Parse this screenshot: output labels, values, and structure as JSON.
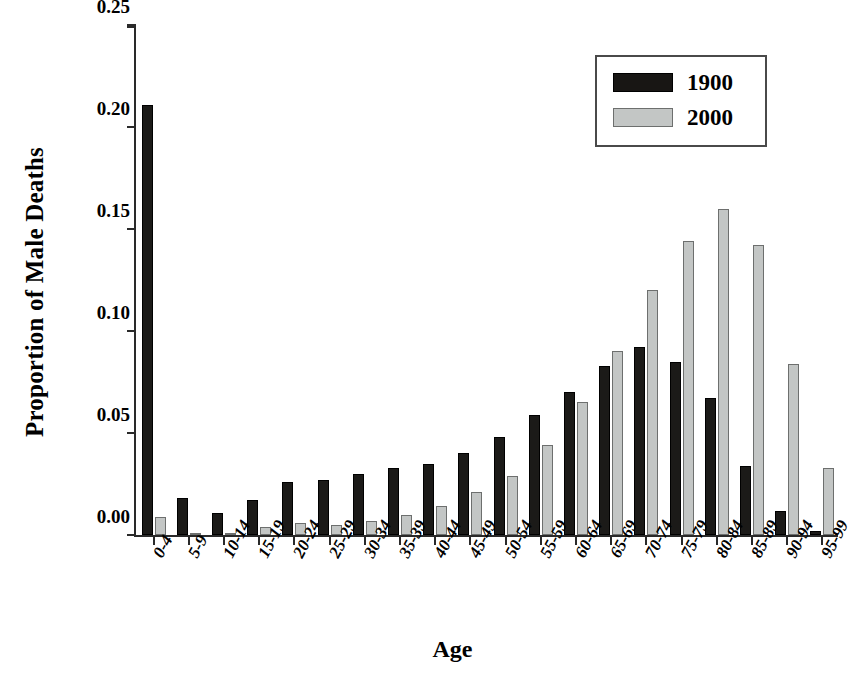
{
  "chart_data": {
    "type": "bar",
    "title": "",
    "xlabel": "Age",
    "ylabel": "Proportion of Male Deaths",
    "ylim": [
      0,
      0.25
    ],
    "yticks": [
      0.0,
      0.05,
      0.1,
      0.15,
      0.2,
      0.25
    ],
    "ytick_labels": [
      "0.00",
      "0.05",
      "0.10",
      "0.15",
      "0.20",
      "0.25"
    ],
    "grid": false,
    "legend_position": "top-right",
    "categories": [
      "0-4",
      "5-9",
      "10-14",
      "15-19",
      "20-24",
      "25-29",
      "30-34",
      "35-39",
      "40-44",
      "45-49",
      "50-54",
      "55-59",
      "60-64",
      "65-69",
      "70-74",
      "75-79",
      "80-84",
      "85-89",
      "90-94",
      "95-99"
    ],
    "series": [
      {
        "name": "1900",
        "color": "#1b1a18",
        "values": [
          0.211,
          0.018,
          0.011,
          0.017,
          0.026,
          0.027,
          0.03,
          0.033,
          0.035,
          0.04,
          0.048,
          0.059,
          0.07,
          0.083,
          0.092,
          0.085,
          0.067,
          0.034,
          0.012,
          0.002
        ]
      },
      {
        "name": "2000",
        "color": "#c3c6c5",
        "values": [
          0.009,
          0.001,
          0.0005,
          0.004,
          0.006,
          0.005,
          0.007,
          0.01,
          0.014,
          0.021,
          0.029,
          0.044,
          0.065,
          0.09,
          0.12,
          0.144,
          0.16,
          0.142,
          0.084,
          0.033
        ]
      }
    ]
  },
  "legend": {
    "entries": [
      {
        "label": "1900"
      },
      {
        "label": "2000"
      }
    ]
  },
  "axes": {
    "x_title": "Age",
    "y_title": "Proportion of Male Deaths"
  }
}
